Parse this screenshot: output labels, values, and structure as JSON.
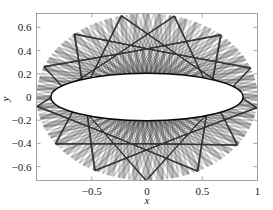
{
  "figure": {
    "background_color": "#ffffff",
    "axes_color": "#9a9a9a",
    "curve_color": "#3b3b3b",
    "caustic_color": "#0a0a0a"
  },
  "chart_data": {
    "type": "line",
    "title": "",
    "subtitle": "",
    "xlabel": "x",
    "ylabel": "y",
    "xlim": [
      -1.0,
      1.0
    ],
    "ylim": [
      -0.72,
      0.72
    ],
    "grid": false,
    "legend": null,
    "xticks": [
      -1,
      -0.5,
      0,
      0.5,
      1
    ],
    "xticklabels": [
      "",
      "-0.5",
      "0",
      "0.5",
      "1"
    ],
    "yticks": [
      -0.6,
      -0.4,
      -0.2,
      0,
      0.2,
      0.4,
      0.6
    ],
    "yticklabels": [
      "-0.6",
      "-0.4",
      "-0.2",
      "0",
      "0.2",
      "0.4",
      "0.6"
    ],
    "annotations": [],
    "series": [
      {
        "name": "trajectory-family",
        "kind": "envelope-web",
        "count": 160,
        "outer_boundary": {
          "shape": "ellipse",
          "a": 1.0,
          "b": 0.72
        },
        "inner_caustic": {
          "shape": "ellipse",
          "a": 0.87,
          "b": 0.205
        }
      },
      {
        "name": "inner-caustic-ellipse",
        "kind": "ellipse",
        "a": 0.87,
        "b": 0.205
      }
    ]
  },
  "axis": {
    "x_label": "x",
    "y_label": "y",
    "x_tick_labels": [
      "-0.5",
      "0",
      "0.5",
      "1"
    ],
    "y_tick_labels": [
      "0.6",
      "0.4",
      "0.2",
      "0",
      "-0.2",
      "-0.4",
      "-0.6"
    ]
  }
}
